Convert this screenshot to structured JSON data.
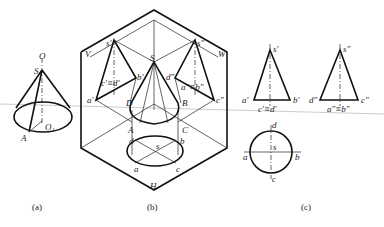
{
  "figures": {
    "a": {
      "caption": "(a)",
      "labels": {
        "axis": "O",
        "apex": "S",
        "base_point": "A",
        "base_center": "O₁"
      }
    },
    "b": {
      "caption": "(b)",
      "planes": {
        "front": "V",
        "side": "W",
        "horizontal": "H"
      },
      "labels": {
        "apex": "S",
        "A": "A",
        "B": "B",
        "C": "C",
        "D": "D",
        "s_prime": "s′",
        "a_prime": "a′",
        "b_prime": "b′",
        "cd_prime": "c′≡d′",
        "s_dprime": "s″",
        "d_dprime": "d″",
        "c_dprime": "c″",
        "ab_dprime": "a″≡b″",
        "s": "s",
        "a": "a",
        "b": "b",
        "c": "c",
        "d": "d"
      }
    },
    "c": {
      "caption": "(c)",
      "front": {
        "apex": "s′",
        "left": "a′",
        "right": "b′",
        "mid": "c′≡d′"
      },
      "side": {
        "apex": "s″",
        "left": "d″",
        "right": "c″",
        "mid": "a″≡b″"
      },
      "top": {
        "top": "d",
        "left": "a",
        "right": "b",
        "bottom": "c",
        "center": "s"
      }
    }
  }
}
